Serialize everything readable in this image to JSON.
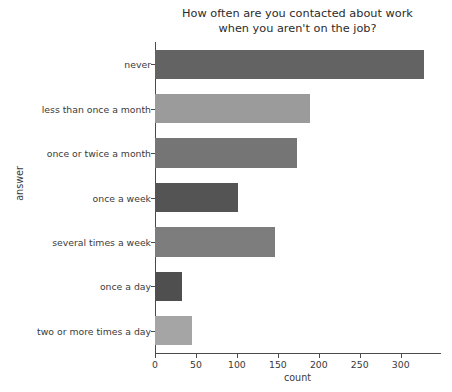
{
  "chart_data": {
    "type": "bar",
    "orientation": "horizontal",
    "title": "How often are you contacted about work\nwhen you aren't on the job?",
    "xlabel": "count",
    "ylabel": "answer",
    "categories": [
      "never",
      "less than once a month",
      "once or twice a month",
      "once a week",
      "several times a week",
      "once a day",
      "two or more times a day"
    ],
    "values": [
      329,
      189,
      173,
      101,
      146,
      33,
      45
    ],
    "colors": [
      "#636363",
      "#9b9b9b",
      "#757575",
      "#545454",
      "#7d7d7d",
      "#4f4f4f",
      "#a5a5a5"
    ],
    "xlim": [
      0,
      348
    ],
    "xticks": [
      0,
      50,
      100,
      150,
      200,
      250,
      300
    ],
    "xtick_labels": [
      "0",
      "50",
      "100",
      "150",
      "200",
      "250",
      "300"
    ],
    "grid": false,
    "legend": false,
    "axis_color": "#4a4a4a",
    "text_color": "#3a3a3a",
    "background": "#ffffff"
  }
}
